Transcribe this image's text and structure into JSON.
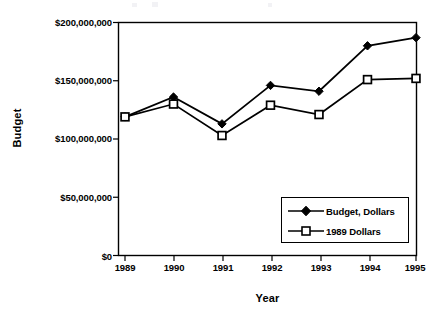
{
  "chart_data": {
    "type": "line",
    "title": "",
    "subtitle": "",
    "xlabel": "Year",
    "ylabel": "Budget",
    "categories": [
      "1989",
      "1990",
      "1991",
      "1992",
      "1993",
      "1994",
      "1995"
    ],
    "x": [
      1989,
      1990,
      1991,
      1992,
      1993,
      1994,
      1995
    ],
    "series": [
      {
        "name": "Budget, Dollars",
        "marker": "filled-diamond",
        "color": "#000000",
        "values": [
          119000000,
          136000000,
          113000000,
          146000000,
          141000000,
          180000000,
          187000000
        ]
      },
      {
        "name": "1989 Dollars",
        "marker": "open-square",
        "color": "#000000",
        "values": [
          119000000,
          130000000,
          103000000,
          129000000,
          121000000,
          151000000,
          152000000
        ]
      }
    ],
    "ylim": [
      0,
      200000000
    ],
    "ytick_values": [
      0,
      50000000,
      100000000,
      150000000,
      200000000
    ],
    "ytick_labels": [
      "$0",
      "$50,000,000",
      "$100,000,000",
      "$150,000,000",
      "$200,000,000"
    ],
    "xtick_labels": [
      "1989",
      "1990",
      "1991",
      "1992",
      "1993",
      "1994",
      "1995"
    ],
    "grid": false,
    "legend_position": "lower-right-inside",
    "legend_entries": [
      "Budget, Dollars",
      "1989 Dollars"
    ],
    "axis_color": "#000000",
    "background": "#ffffff"
  },
  "axes": {
    "y_title": "Budget",
    "x_title": "Year"
  },
  "legend": {
    "items": [
      {
        "label": "Budget, Dollars",
        "marker": "filled-diamond"
      },
      {
        "label": "1989 Dollars",
        "marker": "open-square"
      }
    ]
  }
}
